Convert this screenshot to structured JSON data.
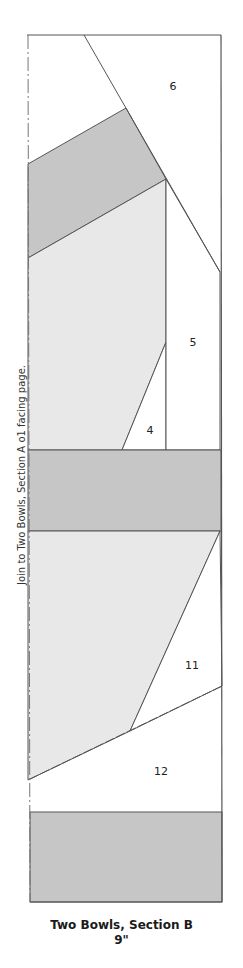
{
  "diagram": {
    "title": "Two Bowls, Section B",
    "size": "9\"",
    "side_note": "Join to Two Bowls, Section A o1 facing page.",
    "colors": {
      "outline": "#555555",
      "dark_fabric": "#c6c6c6",
      "light_fabric": "#e8e8e8",
      "background": "#ffffff"
    },
    "pieces": [
      {
        "id": "6",
        "label": "6"
      },
      {
        "id": "5",
        "label": "5"
      },
      {
        "id": "4",
        "label": "4"
      },
      {
        "id": "11",
        "label": "11"
      },
      {
        "id": "12",
        "label": "12"
      }
    ]
  }
}
